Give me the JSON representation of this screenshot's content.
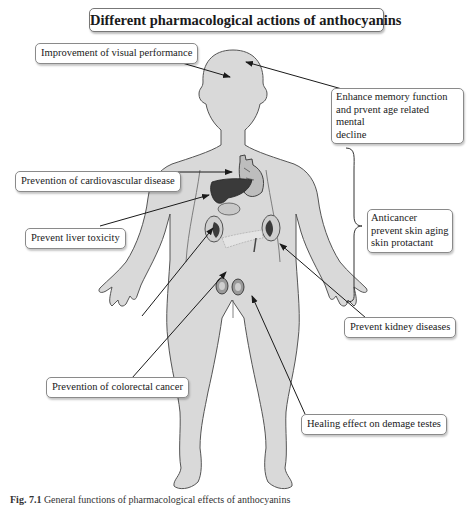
{
  "title": "Different pharmacological actions of anthocyanins",
  "labels": {
    "visual": "Improvement of visual performance",
    "memory": "Enhance memory function and prvent age related mental decline",
    "memory_lines": [
      "Enhance memory function",
      "and prvent age related mental",
      "decline"
    ],
    "cardio": "Prevention of cardiovascular disease",
    "liver": "Prevent liver toxicity",
    "skin_lines": [
      "Anticancer",
      "prevent skin aging",
      "skin protactant"
    ],
    "kidney": "Prevent kidney diseases",
    "colorectal": "Prevention of colorectal cancer",
    "testes": "Healing effect on demage testes"
  },
  "caption": {
    "prefix": "Fig. 7.1",
    "text": "General functions of pharmacological effects of anthocyanins"
  },
  "colors": {
    "body_fill": "#d9d9d9",
    "body_stroke": "#555555",
    "organ_dark": "#3a3a3a",
    "organ_mid": "#8c8c8c",
    "arrow": "#1a1a1a",
    "label_border": "#8a8a8a"
  }
}
